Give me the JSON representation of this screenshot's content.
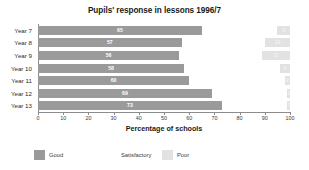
{
  "chart_data": {
    "type": "bar",
    "orientation": "horizontal",
    "stacked": true,
    "title": "Pupils' response in lessons 1996/7",
    "xlabel": "Percentage of schools",
    "ylabel": "",
    "xlim": [
      0,
      100
    ],
    "xticks": [
      0,
      10,
      20,
      30,
      40,
      50,
      60,
      70,
      80,
      90,
      100
    ],
    "xtick_labels": [
      "0",
      "10",
      "20",
      "30",
      "40",
      "50",
      "60",
      "70",
      "80",
      "90",
      "100"
    ],
    "grid": false,
    "legend_position": "bottom-left",
    "categories": [
      "Year 7",
      "Year 8",
      "Year 9",
      "Year 10",
      "Year 11",
      "Year 12",
      "Year 13"
    ],
    "series": [
      {
        "name": "Good",
        "color": "#9a9a9a",
        "values": [
          65,
          57,
          56,
          58,
          60,
          69,
          73
        ],
        "labels": [
          "65",
          "57",
          "56",
          "58",
          "60",
          "69",
          "73"
        ]
      },
      {
        "name": "Satisfactory",
        "color": "#ffffff",
        "values": [
          30,
          33,
          33,
          38,
          38,
          30,
          26
        ],
        "labels": [
          "",
          "",
          "",
          "",
          "",
          "",
          ""
        ]
      },
      {
        "name": "Poor",
        "color": "#e2e2e2",
        "values": [
          5,
          10,
          11,
          4,
          2,
          1,
          1
        ],
        "labels": [
          "5",
          "10",
          "11",
          "4",
          "2",
          "1",
          "1"
        ]
      }
    ]
  },
  "legend": {
    "items": [
      {
        "label": "Good",
        "color": "#9a9a9a"
      },
      {
        "label": "Satisfactory",
        "color": "#ffffff"
      },
      {
        "label": "Poor",
        "color": "#e2e2e2"
      }
    ]
  }
}
